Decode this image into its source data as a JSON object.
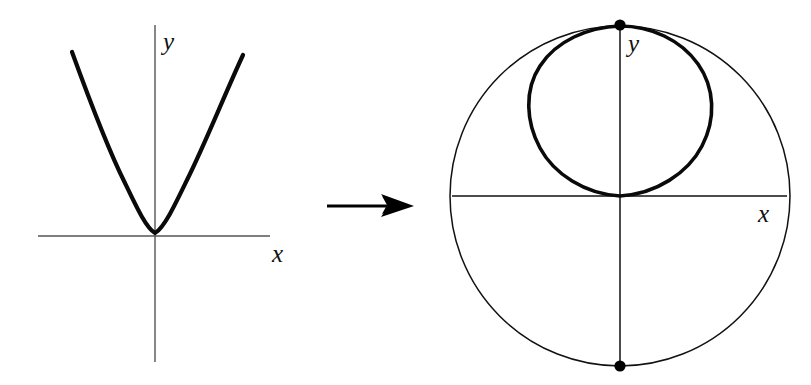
{
  "figure": {
    "background_color": "#ffffff",
    "stroke_color": "#111111",
    "axis_color": "#555555",
    "width": 811,
    "height": 385
  },
  "left_panel": {
    "name": "parabola-plane-diagram",
    "x_axis_label": "x",
    "y_axis_label": "y",
    "curve_name": "parabola",
    "curve_description": "upward-opening parabola with vertex at the origin",
    "origin": {
      "x": 155,
      "y": 236
    },
    "x_axis": {
      "x1": 38,
      "y1": 236,
      "x2": 270,
      "y2": 236
    },
    "y_axis": {
      "x1": 155,
      "y1": 25,
      "x2": 155,
      "y2": 362
    },
    "x_label_pos": {
      "x": 272,
      "y": 262
    },
    "y_label_pos": {
      "x": 163,
      "y": 50
    },
    "parabola_points": [
      {
        "x": 72,
        "y": 52
      },
      {
        "x": 97,
        "y": 110
      },
      {
        "x": 120,
        "y": 168
      },
      {
        "x": 140,
        "y": 214
      },
      {
        "x": 155,
        "y": 234
      },
      {
        "x": 172,
        "y": 216
      },
      {
        "x": 195,
        "y": 170
      },
      {
        "x": 220,
        "y": 112
      },
      {
        "x": 243,
        "y": 55
      }
    ]
  },
  "arrow": {
    "name": "maps-to-arrow",
    "description": "arrow indicating the projection map",
    "shaft": {
      "x1": 327,
      "y1": 206,
      "x2": 398,
      "y2": 206
    },
    "tip": {
      "x": 414,
      "y": 206
    }
  },
  "right_panel": {
    "name": "riemann-sphere-diagram",
    "x_axis_label": "x",
    "y_axis_label": "y",
    "sphere_outline_name": "sphere-outline-circle",
    "projected_curve_name": "projected-parabola-loop",
    "center": {
      "x": 620,
      "y": 196
    },
    "radius": 165,
    "x_axis": {
      "x1": 455,
      "y1": 196,
      "x2": 785,
      "y2": 196
    },
    "y_axis": {
      "x1": 620,
      "y1": 25,
      "x2": 620,
      "y2": 367
    },
    "x_label_pos": {
      "x": 760,
      "y": 222
    },
    "y_label_pos": {
      "x": 628,
      "y": 52
    },
    "north_pole": {
      "x": 620,
      "y": 25,
      "label": "north-pole-point"
    },
    "south_pole": {
      "x": 620,
      "y": 366,
      "label": "south-pole-point"
    },
    "pole_dot_radius": 5.5,
    "loop_bounds": {
      "left": 528,
      "right": 713,
      "top": 25,
      "bottom": 197
    },
    "loop_description": "closed teardrop loop from the north pole down to the origin, tangent to the x-axis"
  }
}
